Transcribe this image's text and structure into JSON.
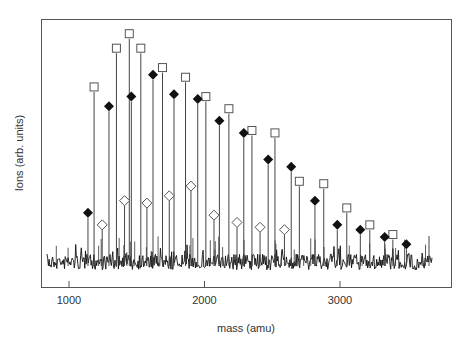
{
  "chart_data": {
    "type": "scatter",
    "subtype": "mass-spectrum-stick-plot",
    "title": "",
    "xlabel": "mass (amu)",
    "ylabel": "Ions (arb. units)",
    "xlim": [
      790,
      3960
    ],
    "ylim": [
      0,
      100
    ],
    "x_ticks": [
      1000,
      2000,
      3000
    ],
    "x_tick_labels": [
      "1000",
      "2000",
      "3000"
    ],
    "y_ticks": [],
    "grid": false,
    "legend": null,
    "baseline_noise_level": 8,
    "series": [
      {
        "name": "open-square",
        "marker": "square-open",
        "x": [
          1185,
          1350,
          1445,
          1530,
          1690,
          1860,
          2010,
          2180,
          2350,
          2520,
          2700,
          2880,
          3050,
          3220,
          3390
        ],
        "values": [
          74,
          90,
          96,
          90,
          82,
          78,
          70,
          65,
          56,
          55,
          35,
          34,
          24,
          17,
          13
        ]
      },
      {
        "name": "filled-diamond",
        "marker": "diamond-filled",
        "x": [
          1140,
          1295,
          1460,
          1620,
          1775,
          1950,
          2110,
          2290,
          2470,
          2640,
          2815,
          2980,
          3150,
          3330,
          3490
        ],
        "values": [
          22,
          66,
          70,
          79,
          71,
          69,
          60,
          55,
          44,
          41,
          27,
          17,
          15,
          12,
          9
        ]
      },
      {
        "name": "open-diamond",
        "marker": "diamond-open",
        "x": [
          1245,
          1410,
          1575,
          1740,
          1900,
          2070,
          2240,
          2410,
          2590
        ],
        "values": [
          17,
          27,
          26,
          29,
          33,
          21,
          18,
          16,
          15
        ]
      }
    ]
  },
  "axes": {
    "xlabel": "mass (amu)",
    "ylabel": "Ions (arb. units)",
    "ticks": [
      "1000",
      "2000",
      "3000"
    ]
  }
}
